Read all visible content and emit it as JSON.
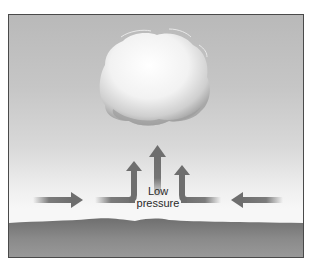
{
  "diagram": {
    "title": "",
    "label": {
      "line1": "Low",
      "line2": "pressure"
    },
    "elements": {
      "cloud": "cumulus cloud above center",
      "arrows": [
        {
          "id": "left-inflow",
          "direction": "right"
        },
        {
          "id": "left-rising",
          "direction": "right-then-up"
        },
        {
          "id": "center-rising",
          "direction": "up"
        },
        {
          "id": "right-rising",
          "direction": "left-then-up"
        },
        {
          "id": "right-inflow",
          "direction": "left"
        }
      ],
      "ground": "dark ground surface"
    },
    "colors": {
      "arrow": "#6e6e6e",
      "ground": "#7a7a7a",
      "sky_top": "#b9b9b9",
      "sky_bottom": "#f7f7f7",
      "cloud": "#f4f4f4"
    }
  }
}
